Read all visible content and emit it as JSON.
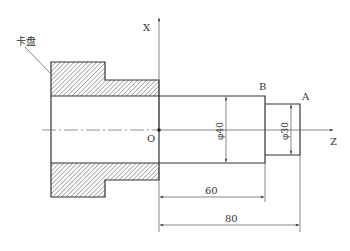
{
  "diagram": {
    "chuck_label": "卡盘",
    "axis_x_label": "X",
    "axis_z_label": "Z",
    "origin_label": "O",
    "point_b_label": "B",
    "point_a_label": "A",
    "dim_dia_large": "φ40",
    "dim_dia_small": "φ30",
    "dim_len_60": "60",
    "dim_len_80": "80"
  },
  "colors": {
    "line": "#333333",
    "hatch": "#555555",
    "thin": "#555555",
    "background": "#ffffff"
  }
}
